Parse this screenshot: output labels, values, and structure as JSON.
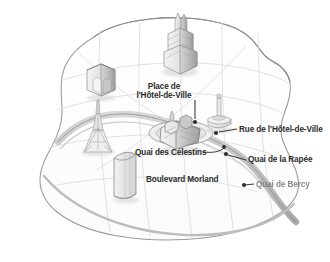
{
  "figure": {
    "name": "paris-illustrated-map",
    "kind": "illustrated perspective city map",
    "background_color": "#ffffff",
    "ink_color": "#2b2b2b",
    "line_color": "#8c8c8c",
    "river_color": "#b9b9b9",
    "landmark_fill": "#e6e6e6"
  },
  "labels": [
    {
      "id": "place-hotel-de-ville",
      "text": "Place de l'Hôtel-de-Ville",
      "line1": "Place de",
      "line2": "l'Hôtel-de-Ville"
    },
    {
      "id": "rue-hotel-de-ville",
      "text": "Rue de l'Hôtel-de-Ville"
    },
    {
      "id": "quai-celestins",
      "text": "Quai des Célestins"
    },
    {
      "id": "quai-rapee",
      "text": "Quai de la Rapée"
    },
    {
      "id": "boulevard-morland",
      "text": "Boulevard Morland"
    },
    {
      "id": "quai-bercy",
      "text": "Quai de Bercy"
    }
  ],
  "landmarks": [
    {
      "id": "cathedral",
      "name": "cathedral-landmark"
    },
    {
      "id": "arc",
      "name": "arc-de-triomphe-landmark"
    },
    {
      "id": "eiffel",
      "name": "eiffel-tower-landmark"
    },
    {
      "id": "tower-block",
      "name": "cylindrical-tower-landmark"
    },
    {
      "id": "july-column",
      "name": "july-column-landmark"
    },
    {
      "id": "ile-cite",
      "name": "island-building-cluster-landmark"
    }
  ],
  "leader_dots": [
    {
      "id": "dot-place-hotel-de-ville"
    },
    {
      "id": "dot-rue-hotel-de-ville"
    },
    {
      "id": "dot-quai-rapee"
    },
    {
      "id": "dot-quai-celestins"
    },
    {
      "id": "dot-quai-bercy"
    }
  ]
}
